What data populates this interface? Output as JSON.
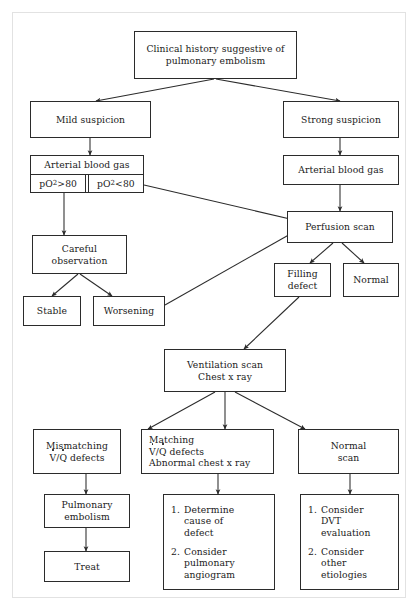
{
  "diagram": {
    "line_color": "#2b2b2b",
    "background": "#ffffff"
  },
  "nodes": {
    "clinical_history": {
      "line1": "Clinical history suggestive of",
      "line2": "pulmonary embolism"
    },
    "mild_suspicion": {
      "line1": "Mild suspicion"
    },
    "strong_suspicion": {
      "line1": "Strong suspicion"
    },
    "abg_left": {
      "header": "Arterial blood gas",
      "cell_high_pre": "pO",
      "cell_high_sub": "2",
      "cell_high_post": ">80",
      "cell_low_pre": "pO",
      "cell_low_sub": "2",
      "cell_low_post": "<80"
    },
    "abg_right": {
      "line1": "Arterial blood gas"
    },
    "perfusion_scan": {
      "line1": "Perfusion scan"
    },
    "careful_observation": {
      "line1": "Careful",
      "line2": "observation"
    },
    "filling_defect": {
      "line1": "Filling",
      "line2": "defect"
    },
    "normal": {
      "line1": "Normal"
    },
    "stable": {
      "line1": "Stable"
    },
    "worsening": {
      "line1": "Worsening"
    },
    "ventilation_scan": {
      "line1": "Ventilation scan",
      "line2": "Chest x ray"
    },
    "mismatching": {
      "line1": "Mismatching",
      "v": "V",
      "slash": "/",
      "q": "Q",
      "rest": " defects"
    },
    "matching": {
      "line1": "Matching",
      "v": "V",
      "slash": "/",
      "q": "Q",
      "rest": " defects",
      "line3": "Abnormal chest x ray"
    },
    "normal_scan": {
      "line1": "Normal",
      "line2": "scan"
    },
    "pulmonary_embolism": {
      "line1": "Pulmonary",
      "line2": "embolism"
    },
    "treat": {
      "line1": "Treat"
    },
    "middle_actions": {
      "items": [
        {
          "num": "1.",
          "lines": [
            "Determine",
            "cause of",
            "defect"
          ]
        },
        {
          "num": "2.",
          "lines": [
            "Consider",
            "pulmonary",
            "angiogram"
          ]
        }
      ]
    },
    "right_actions": {
      "items": [
        {
          "num": "1.",
          "lines": [
            "Consider",
            "DVT",
            "evaluation"
          ]
        },
        {
          "num": "2.",
          "lines": [
            "Consider",
            "other",
            "etiologies"
          ]
        }
      ]
    }
  },
  "edges": [
    {
      "from": "clinical_history",
      "to": "mild_suspicion"
    },
    {
      "from": "clinical_history",
      "to": "strong_suspicion"
    },
    {
      "from": "mild_suspicion",
      "to": "abg_left"
    },
    {
      "from": "strong_suspicion",
      "to": "abg_right"
    },
    {
      "from": "abg_right",
      "to": "perfusion_scan"
    },
    {
      "from": "abg_left_low",
      "to": "perfusion_scan"
    },
    {
      "from": "abg_left_high",
      "to": "careful_observation"
    },
    {
      "from": "careful_observation",
      "to": "stable"
    },
    {
      "from": "careful_observation",
      "to": "worsening"
    },
    {
      "from": "worsening",
      "to": "perfusion_scan"
    },
    {
      "from": "perfusion_scan",
      "to": "filling_defect"
    },
    {
      "from": "perfusion_scan",
      "to": "normal"
    },
    {
      "from": "filling_defect",
      "to": "ventilation_scan"
    },
    {
      "from": "ventilation_scan",
      "to": "mismatching"
    },
    {
      "from": "ventilation_scan",
      "to": "matching"
    },
    {
      "from": "ventilation_scan",
      "to": "normal_scan"
    },
    {
      "from": "mismatching",
      "to": "pulmonary_embolism"
    },
    {
      "from": "pulmonary_embolism",
      "to": "treat"
    },
    {
      "from": "matching",
      "to": "middle_actions"
    },
    {
      "from": "normal_scan",
      "to": "right_actions"
    }
  ]
}
